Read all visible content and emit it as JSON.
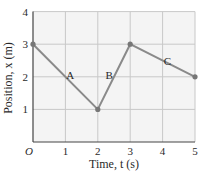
{
  "chart_data": {
    "type": "line",
    "title": "",
    "xlabel": "Time, t (s)",
    "ylabel": "Position, x (m)",
    "xlim": [
      0,
      5
    ],
    "ylim": [
      0,
      4
    ],
    "grid": true,
    "x_ticks": [
      "O",
      "1",
      "2",
      "3",
      "4",
      "5"
    ],
    "y_ticks": [
      "1",
      "2",
      "3",
      "4"
    ],
    "series": [
      {
        "name": "position",
        "x": [
          0,
          2,
          3,
          5
        ],
        "y": [
          3,
          1,
          3,
          2
        ]
      }
    ],
    "annotations": [
      {
        "text": "A",
        "x": 1.15,
        "y": 2.05
      },
      {
        "text": "B",
        "x": 2.35,
        "y": 2.05
      },
      {
        "text": "C",
        "x": 4.15,
        "y": 2.5
      }
    ],
    "colors": {
      "line": "#8a8a8a",
      "grid": "#c8c8c8",
      "axis": "#444444",
      "background": "#f4f4f4"
    }
  }
}
